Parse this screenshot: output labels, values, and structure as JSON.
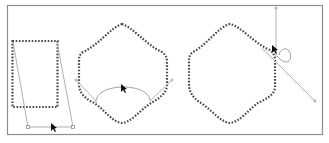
{
  "figure": {
    "colors": {
      "frame": "#8e8e8e",
      "path": "#4a4a4a",
      "handle": "#a8a8a8",
      "cursor": "#111111",
      "background": "#ffffff"
    },
    "panels": [
      {
        "id": "rectangle-skew",
        "shape": "dotted rectangle",
        "handles": "two skew lines joined by a bottom bar",
        "cursor": "arrow on bottom bar"
      },
      {
        "id": "hexagon-curve-bottom",
        "shape": "dotted hexagon with concave curved sides",
        "handles": "two tangent lines and an arc across the bottom",
        "cursor": "arrow on top of arc"
      },
      {
        "id": "hexagon-rotate-node",
        "shape": "dotted hexagon with curved sides",
        "handles": "vertical and diagonal handle lines with a small loop at a node",
        "cursor": "arrow at upper-right node"
      }
    ]
  }
}
